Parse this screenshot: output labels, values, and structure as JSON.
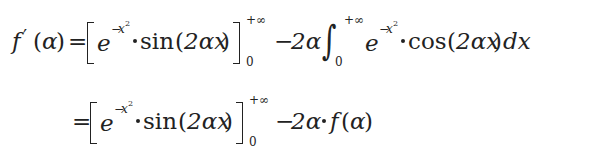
{
  "equation": {
    "line1": {
      "lhs_func": "f",
      "lhs_prime": "′",
      "lhs_open": "(",
      "lhs_var": "α",
      "lhs_close": ")",
      "equals": "=",
      "exp_base": "e",
      "exp_minus": "−",
      "exp_var": "x",
      "exp_pow": "2",
      "sin_fn": "sin",
      "sin_open": "(",
      "sin_arg": "2αx",
      "sin_close": ")",
      "upper_limit": "+∞",
      "lower_limit": "0",
      "minus": "−",
      "coef": "2α",
      "integral": "∫",
      "int_upper": "+∞",
      "int_lower": "0",
      "int_exp_base": "e",
      "int_exp_minus": "−",
      "int_exp_var": "x",
      "int_exp_pow": "2",
      "cos_fn": "cos",
      "cos_open": "(",
      "cos_arg": "2αx",
      "cos_close": ")",
      "differential": "dx"
    },
    "line2": {
      "equals": "=",
      "exp_base": "e",
      "exp_minus": "−",
      "exp_var": "x",
      "exp_pow": "2",
      "sin_fn": "sin",
      "sin_open": "(",
      "sin_arg": "2αx",
      "sin_close": ")",
      "upper_limit": "+∞",
      "lower_limit": "0",
      "minus": "−",
      "coef": "2α",
      "rhs_func": "f",
      "rhs_open": "(",
      "rhs_var": "α",
      "rhs_close": ")"
    },
    "latex_line1": "f'(\\alpha) = \\left[ e^{-x^2} \\cdot \\sin(2\\alpha x) \\right]_0^{+\\infty} - 2\\alpha \\int_0^{+\\infty} e^{-x^2} \\cdot \\cos(2\\alpha x)\\, dx",
    "latex_line2": "= \\left[ e^{-x^2} \\cdot \\sin(2\\alpha x) \\right]_0^{+\\infty} - 2\\alpha \\cdot f(\\alpha)"
  }
}
